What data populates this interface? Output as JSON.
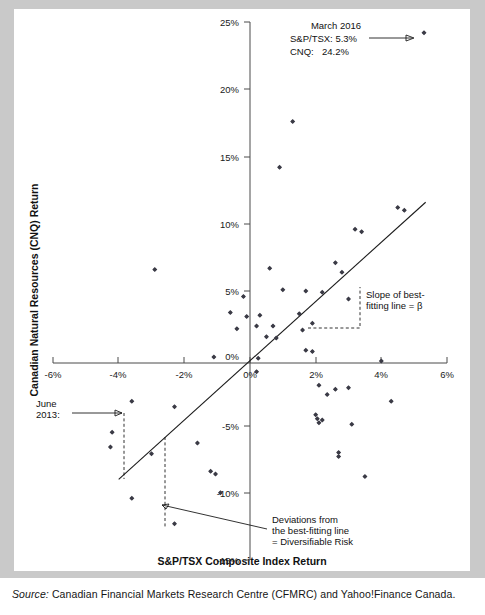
{
  "figure": {
    "source_label": "Source:",
    "source_text": "Canadian Financial Markets Research Centre (CFMRC) and Yahoo!Finance Canada."
  },
  "annotations": {
    "callout_date": "March 2016",
    "callout_line1": "S&P/TSX: 5.3%",
    "callout_line2_label": "CNQ:",
    "callout_line2_value": "24.2%",
    "june_label_line1": "June",
    "june_label_line2": "2013:",
    "slope_line1": "Slope of best-",
    "slope_line2": "fitting line = β",
    "deviation_line1": "Deviations from",
    "deviation_line2": "the best-fitting line",
    "deviation_line3": "= Diversifiable Risk"
  },
  "chart_data": {
    "type": "scatter",
    "title": "",
    "xlabel": "S&P/TSX Composite Index Return",
    "ylabel": "Canadian Natural Resources (CNQ) Return",
    "xlim": [
      -6,
      6
    ],
    "ylim": [
      -15,
      25
    ],
    "xticks": [
      -6,
      -4,
      -2,
      0,
      2,
      4,
      6
    ],
    "xticklabels": [
      "-6%",
      "-4%",
      "-2%",
      "0%",
      "2%",
      "4%",
      "6%"
    ],
    "yticks": [
      -15,
      -10,
      -5,
      0,
      5,
      10,
      15,
      20,
      25
    ],
    "yticklabels": [
      "-15%",
      "-10%",
      "-5%",
      "0%",
      "5%",
      "10%",
      "15%",
      "20%",
      "25%"
    ],
    "grid": false,
    "legend": "none",
    "marker": "diamond",
    "marker_color": "#3b3b46",
    "series": [
      {
        "name": "Monthly returns: S&P/TSX vs CNQ",
        "points": [
          [
            5.3,
            24.2
          ],
          [
            1.3,
            17.6
          ],
          [
            0.9,
            14.2
          ],
          [
            4.5,
            11.2
          ],
          [
            4.7,
            11.0
          ],
          [
            3.2,
            9.6
          ],
          [
            3.4,
            9.4
          ],
          [
            0.6,
            6.7
          ],
          [
            2.6,
            7.1
          ],
          [
            2.8,
            6.4
          ],
          [
            -2.9,
            6.6
          ],
          [
            1.0,
            5.1
          ],
          [
            1.7,
            5.0
          ],
          [
            2.2,
            4.9
          ],
          [
            -0.2,
            4.6
          ],
          [
            3.0,
            4.4
          ],
          [
            -0.6,
            3.4
          ],
          [
            -0.1,
            3.1
          ],
          [
            0.3,
            3.2
          ],
          [
            1.5,
            3.3
          ],
          [
            1.9,
            2.6
          ],
          [
            0.2,
            2.4
          ],
          [
            0.7,
            2.4
          ],
          [
            -0.4,
            2.2
          ],
          [
            1.6,
            2.1
          ],
          [
            0.5,
            1.6
          ],
          [
            0.8,
            1.5
          ],
          [
            1.7,
            0.6
          ],
          [
            1.9,
            0.5
          ],
          [
            -1.1,
            0.1
          ],
          [
            0.25,
            0.0
          ],
          [
            4.0,
            -0.2
          ],
          [
            0.2,
            -1.0
          ],
          [
            2.1,
            -2.0
          ],
          [
            2.6,
            -2.3
          ],
          [
            3.0,
            -2.2
          ],
          [
            2.35,
            -2.7
          ],
          [
            4.3,
            -3.2
          ],
          [
            -3.6,
            -3.2
          ],
          [
            -2.3,
            -3.6
          ],
          [
            2.0,
            -4.2
          ],
          [
            2.05,
            -4.5
          ],
          [
            2.1,
            -4.8
          ],
          [
            2.2,
            -4.6
          ],
          [
            3.1,
            -4.9
          ],
          [
            -4.2,
            -5.5
          ],
          [
            -4.25,
            -6.6
          ],
          [
            -1.6,
            -6.3
          ],
          [
            -3.0,
            -7.1
          ],
          [
            2.7,
            -7.0
          ],
          [
            2.7,
            -7.3
          ],
          [
            -1.2,
            -8.4
          ],
          [
            -1.05,
            -8.6
          ],
          [
            3.5,
            -8.8
          ],
          [
            -0.9,
            -10.0
          ],
          [
            -3.6,
            -10.4
          ],
          [
            -2.3,
            -12.3
          ]
        ]
      }
    ],
    "bestfit": {
      "label": "best-fitting line",
      "x_start": -4.0,
      "y_start": -9.0,
      "x_end": 5.35,
      "y_end": 11.6
    },
    "highlighted_points": [
      {
        "label": "March 2016",
        "x": 5.3,
        "y": 24.2
      },
      {
        "label": "June 2013",
        "x": -4.2,
        "y": -5.5
      }
    ]
  }
}
